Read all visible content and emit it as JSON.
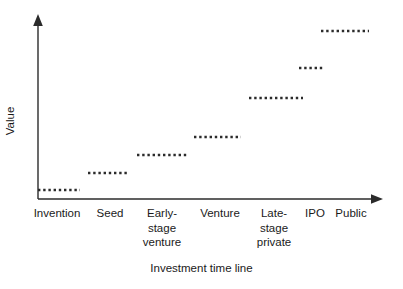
{
  "chart_data": {
    "type": "bar",
    "title": "",
    "subtitle": "",
    "xlabel": "Investment time line",
    "ylabel": "Value",
    "categories": [
      "Invention",
      "Seed",
      "Early-\nstage\nventure",
      "Venture",
      "Late-\nstage\nprivate",
      "IPO",
      "Public"
    ],
    "values": [
      1,
      2,
      3,
      4,
      5,
      6,
      7
    ],
    "series": [
      {
        "name": "Value step",
        "values": [
          1,
          2,
          3,
          4,
          5,
          6,
          7
        ]
      }
    ],
    "xlim": [
      0,
      7
    ],
    "ylim": [
      0,
      7
    ],
    "grid": false,
    "legend": false,
    "legend_position": "none",
    "axis_style": "arrow-ended open axes",
    "marker_style": "dotted horizontal segment",
    "annotations": [],
    "segments": [
      {
        "label": "Invention",
        "x0": 38,
        "x1": 80,
        "y": 190,
        "level": 1
      },
      {
        "label": "Seed",
        "x0": 88,
        "x1": 129,
        "y": 173,
        "level": 2
      },
      {
        "label": "Early-stage venture",
        "x0": 137,
        "x1": 189,
        "y": 155,
        "level": 3
      },
      {
        "label": "Venture",
        "x0": 194,
        "x1": 241,
        "y": 137,
        "level": 4
      },
      {
        "label": "Late-stage private",
        "x0": 249,
        "x1": 303,
        "y": 98,
        "level": 5
      },
      {
        "label": "IPO",
        "x0": 299,
        "x1": 325,
        "y": 68,
        "level": 6
      },
      {
        "label": "Public",
        "x0": 321,
        "x1": 369,
        "y": 31,
        "level": 7
      }
    ]
  },
  "axes": {
    "y_title": "Value",
    "x_title": "Investment time line",
    "origin_x": 38,
    "origin_y": 199,
    "y_top": 16,
    "x_right": 382
  },
  "category_labels": [
    {
      "text": "Invention",
      "left": 26,
      "top": 206,
      "width": 62
    },
    {
      "text": "Seed",
      "left": 92,
      "top": 206,
      "width": 36
    },
    {
      "text": "Early-\nstage\nventure",
      "left": 136,
      "top": 206,
      "width": 52
    },
    {
      "text": "Venture",
      "left": 194,
      "top": 206,
      "width": 52
    },
    {
      "text": "Late-\nstage\nprivate",
      "left": 250,
      "top": 206,
      "width": 48
    },
    {
      "text": "IPO",
      "left": 302,
      "top": 206,
      "width": 26
    },
    {
      "text": "Public",
      "left": 330,
      "top": 206,
      "width": 42
    }
  ],
  "colors": {
    "background": "#ffffff",
    "ink": "#2b2b2b",
    "text": "#1a1a1a"
  }
}
